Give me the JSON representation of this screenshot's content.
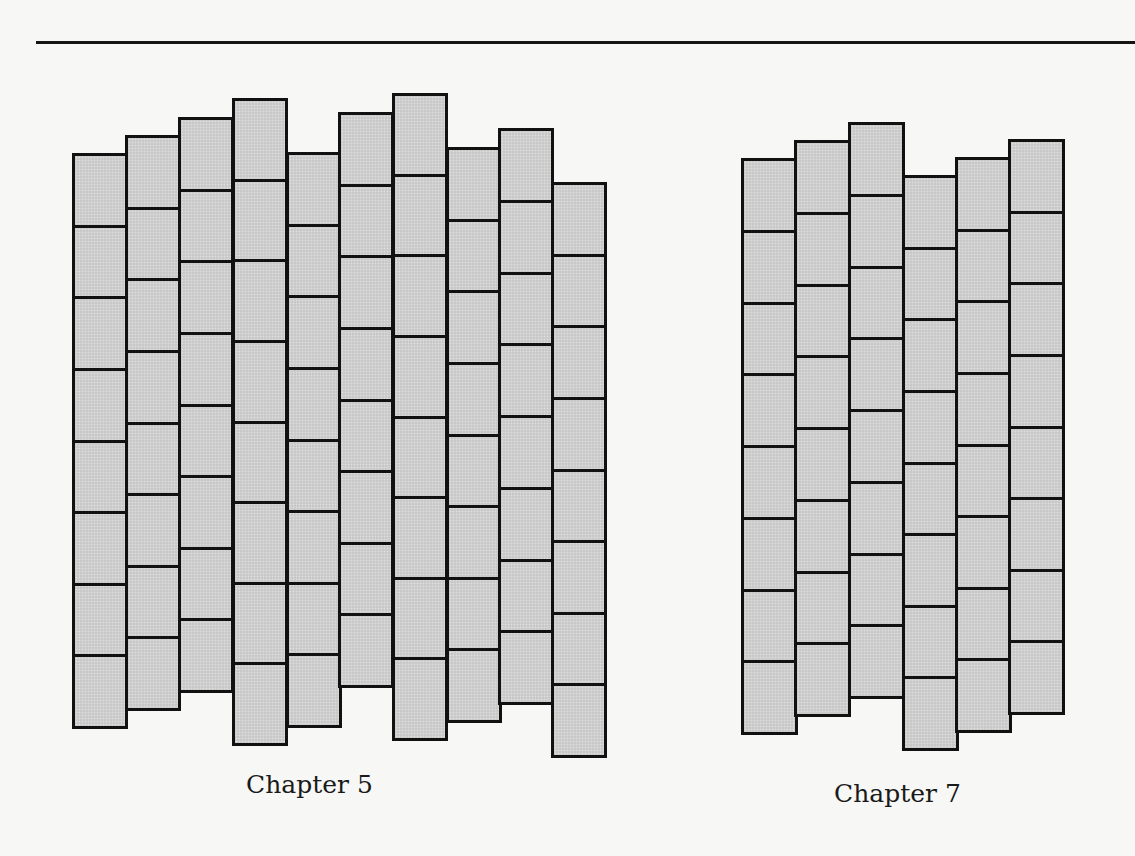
{
  "page": {
    "background": "#f7f7f5",
    "rule_color": "#151515"
  },
  "figures": [
    {
      "id": "chapter-5",
      "caption": "Chapter 5",
      "brick_fill": "#cfcfcf",
      "outline_color": "#111111",
      "bricks_per_column": 8,
      "column_width": 53,
      "columns": [
        {
          "x": 72,
          "top": 153,
          "bottom": 726
        },
        {
          "x": 125,
          "top": 135,
          "bottom": 708
        },
        {
          "x": 178,
          "top": 117,
          "bottom": 690
        },
        {
          "x": 232,
          "top": 98,
          "bottom": 743
        },
        {
          "x": 286,
          "top": 152,
          "bottom": 725
        },
        {
          "x": 338,
          "top": 112,
          "bottom": 685
        },
        {
          "x": 392,
          "top": 93,
          "bottom": 738
        },
        {
          "x": 446,
          "top": 147,
          "bottom": 720
        },
        {
          "x": 498,
          "top": 128,
          "bottom": 702
        },
        {
          "x": 551,
          "top": 182,
          "bottom": 755
        }
      ]
    },
    {
      "id": "chapter-7",
      "caption": "Chapter 7",
      "brick_fill": "#cfcfcf",
      "outline_color": "#111111",
      "bricks_per_column": 8,
      "column_width": 54,
      "columns": [
        {
          "x": 741,
          "top": 158,
          "bottom": 732
        },
        {
          "x": 794,
          "top": 140,
          "bottom": 714
        },
        {
          "x": 848,
          "top": 122,
          "bottom": 696
        },
        {
          "x": 902,
          "top": 175,
          "bottom": 748
        },
        {
          "x": 955,
          "top": 157,
          "bottom": 730
        },
        {
          "x": 1008,
          "top": 139,
          "bottom": 712
        }
      ]
    }
  ]
}
